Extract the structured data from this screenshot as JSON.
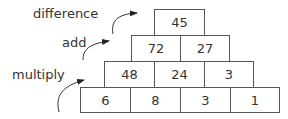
{
  "labels": {
    "difference": "difference",
    "add": "add",
    "multiply": "multiply"
  },
  "pyramid": {
    "row1": [
      "45"
    ],
    "row2": [
      "72",
      "27"
    ],
    "row3": [
      "48",
      "24",
      "3"
    ],
    "row4": [
      "6",
      "8",
      "3",
      "1"
    ]
  }
}
